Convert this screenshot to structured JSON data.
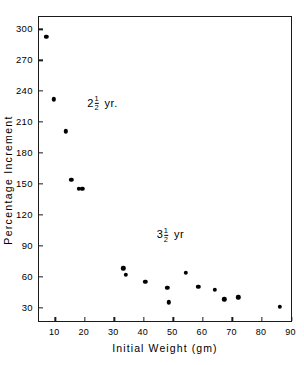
{
  "chart_data": {
    "type": "scatter",
    "title": "",
    "xlabel": "Initial  Weight  (gm)",
    "ylabel": "Percentage  Increment",
    "xlim": [
      4.5,
      90.5
    ],
    "ylim": [
      15,
      312
    ],
    "xticks": [
      10,
      20,
      30,
      40,
      50,
      60,
      70,
      80,
      90
    ],
    "yticks": [
      30,
      60,
      90,
      120,
      150,
      180,
      210,
      240,
      270,
      300
    ],
    "xtick_labels": [
      "10",
      "20",
      "30",
      "40",
      "50",
      "60",
      "70",
      "80",
      "90"
    ],
    "ytick_labels": [
      "30",
      "60",
      "90",
      "120",
      "150",
      "180",
      "210",
      "240",
      "270",
      "300"
    ],
    "grid": false,
    "legend": "none",
    "marker": "filled-circle",
    "marker_color": "#000000",
    "series": [
      {
        "name": "2 1/2 yr.",
        "points": [
          {
            "x": 7.0,
            "y": 293
          },
          {
            "x": 9.5,
            "y": 232
          },
          {
            "x": 13.5,
            "y": 201
          },
          {
            "x": 15.5,
            "y": 154
          },
          {
            "x": 18.0,
            "y": 145
          },
          {
            "x": 19.2,
            "y": 145
          }
        ]
      },
      {
        "name": "3 1/2 yr",
        "points": [
          {
            "x": 33.0,
            "y": 68
          },
          {
            "x": 33.8,
            "y": 62
          },
          {
            "x": 40.5,
            "y": 55
          },
          {
            "x": 48.0,
            "y": 49
          },
          {
            "x": 48.5,
            "y": 35
          },
          {
            "x": 54.2,
            "y": 64
          },
          {
            "x": 58.5,
            "y": 50
          },
          {
            "x": 64.0,
            "y": 47
          },
          {
            "x": 67.2,
            "y": 38
          },
          {
            "x": 72.0,
            "y": 40
          },
          {
            "x": 86.0,
            "y": 31
          }
        ]
      }
    ],
    "annotations": [
      {
        "text_whole": "2",
        "fraction_num": "1",
        "fraction_den": "2",
        "unit": "yr.",
        "x": 26,
        "y": 228
      },
      {
        "text_whole": "3",
        "fraction_num": "1",
        "fraction_den": "2",
        "unit": "yr",
        "x": 49,
        "y": 100
      }
    ]
  }
}
